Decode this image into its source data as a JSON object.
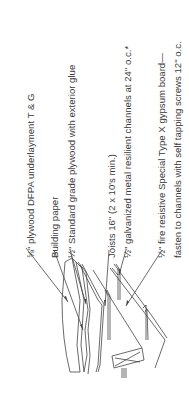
{
  "diagram": {
    "type": "construction-section-detail",
    "orientation": "rotated-90-ccw",
    "labels": [
      {
        "id": "plywood-underlayment",
        "text": "⅝\" plywood DFPA underlayment T & G"
      },
      {
        "id": "building-paper",
        "text": "Building paper"
      },
      {
        "id": "standard-plywood",
        "text": "½\" Standard grade plywood with exterior glue"
      },
      {
        "id": "joists",
        "text": "Joists 16\" (2 x 10's min.)"
      },
      {
        "id": "resilient-channels",
        "text": "½\" galvanized metal resilient channels at 24\" o.c.*"
      },
      {
        "id": "gypsum-board-line1",
        "text": "½\" fire resistive Special Type X gypsum board—"
      },
      {
        "id": "gypsum-board-line2",
        "text": "fasten to channels with self tapping screws 12\" o.c."
      }
    ],
    "colors": {
      "line": "#444444",
      "text": "#3a3a3a",
      "background": "#ffffff"
    }
  }
}
